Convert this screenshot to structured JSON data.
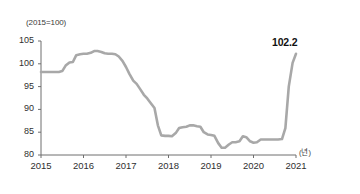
{
  "chart_data": {
    "type": "line",
    "title": "",
    "subtitle": "",
    "xlabel": "(년)",
    "ylabel": "(2015=100)",
    "xlim": [
      2015.0,
      2021.0
    ],
    "ylim": [
      80,
      105
    ],
    "grid": false,
    "legend": null,
    "line_color": "#a8a8a8",
    "y_ticks": [
      105,
      100,
      95,
      90,
      85,
      80
    ],
    "x_ticks": [
      2015,
      2016,
      2017,
      2018,
      2019,
      2020,
      2021
    ],
    "annotations": [
      {
        "text": "102.2",
        "x": 2021.0,
        "y": 102.2,
        "bold": true
      }
    ],
    "series": [
      {
        "name": "Index (2015=100)",
        "x": [
          2015.0,
          2015.08,
          2015.17,
          2015.25,
          2015.33,
          2015.42,
          2015.5,
          2015.58,
          2015.67,
          2015.75,
          2015.83,
          2015.92,
          2016.0,
          2016.08,
          2016.17,
          2016.25,
          2016.33,
          2016.42,
          2016.5,
          2016.58,
          2016.67,
          2016.75,
          2016.83,
          2016.92,
          2017.0,
          2017.08,
          2017.17,
          2017.25,
          2017.33,
          2017.42,
          2017.5,
          2017.58,
          2017.67,
          2017.75,
          2017.83,
          2017.92,
          2018.0,
          2018.08,
          2018.17,
          2018.25,
          2018.33,
          2018.42,
          2018.5,
          2018.58,
          2018.67,
          2018.75,
          2018.83,
          2018.92,
          2019.0,
          2019.08,
          2019.17,
          2019.25,
          2019.33,
          2019.42,
          2019.5,
          2019.58,
          2019.67,
          2019.75,
          2019.83,
          2019.92,
          2020.0,
          2020.08,
          2020.17,
          2020.25,
          2020.33,
          2020.42,
          2020.5,
          2020.58,
          2020.67,
          2020.75,
          2020.83,
          2020.92,
          2021.0
        ],
        "values": [
          98.2,
          98.2,
          98.2,
          98.2,
          98.2,
          98.2,
          98.4,
          99.6,
          100.3,
          100.4,
          101.9,
          102.1,
          102.2,
          102.2,
          102.4,
          102.8,
          102.8,
          102.6,
          102.3,
          102.2,
          102.2,
          102.1,
          101.6,
          100.6,
          99.3,
          97.8,
          96.3,
          95.6,
          94.5,
          93.2,
          92.4,
          91.4,
          90.3,
          86.5,
          84.3,
          84.2,
          84.2,
          84.1,
          84.8,
          85.9,
          86.1,
          86.2,
          86.5,
          86.5,
          86.3,
          86.2,
          85.0,
          84.5,
          84.4,
          84.2,
          82.6,
          81.6,
          81.6,
          82.3,
          82.8,
          82.8,
          83.0,
          84.1,
          83.9,
          83.0,
          82.7,
          82.8,
          83.4,
          83.4,
          83.4,
          83.4,
          83.4,
          83.4,
          83.5,
          85.9,
          95.0,
          100.2,
          102.2
        ]
      }
    ]
  },
  "axis_labels": {
    "y_unit": "(2015=100)",
    "x_unit": "(년)"
  }
}
